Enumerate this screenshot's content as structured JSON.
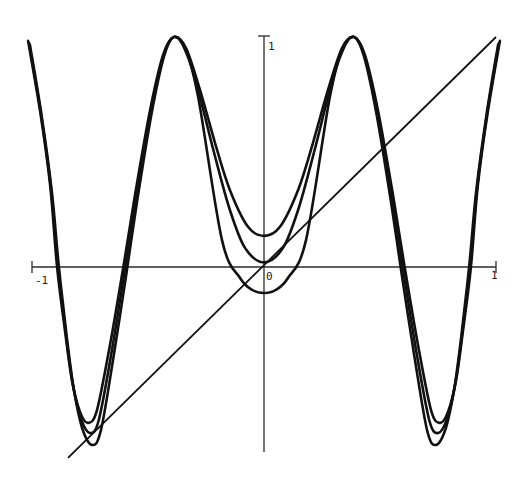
{
  "chart_data": {
    "type": "line",
    "title": "",
    "xlabel": "",
    "ylabel": "",
    "xlim": [
      -1,
      1
    ],
    "ylim": [
      -0.9,
      1
    ],
    "grid": false,
    "legend": null,
    "tick_labels": {
      "x_min": "-1",
      "x_max": "1",
      "origin": "0",
      "y_max": "1"
    },
    "series": [
      {
        "name": "curve-upper",
        "x": [
          -1.017,
          -0.966,
          -0.922,
          -0.892,
          -0.858,
          -0.828,
          -0.793,
          -0.759,
          -0.72,
          -0.664,
          -0.603,
          -0.556,
          -0.491,
          -0.435,
          -0.388,
          -0.336,
          -0.276,
          -0.211,
          -0.147,
          -0.069,
          0
        ],
        "y": [
          0.983,
          0.683,
          0.357,
          0.0,
          -0.274,
          -0.491,
          -0.63,
          -0.678,
          -0.622,
          -0.339,
          0.02,
          0.313,
          0.683,
          0.922,
          1.0,
          0.952,
          0.77,
          0.54,
          0.335,
          0.175,
          0.135
        ],
        "symmetric": true
      },
      {
        "name": "curve-middle",
        "x": [
          -1.013,
          -0.962,
          -0.918,
          -0.888,
          -0.854,
          -0.824,
          -0.789,
          -0.75,
          -0.712,
          -0.657,
          -0.598,
          -0.552,
          -0.488,
          -0.433,
          -0.388,
          -0.338,
          -0.28,
          -0.216,
          -0.147,
          -0.082,
          0
        ],
        "y": [
          0.975,
          0.67,
          0.34,
          0.0,
          -0.29,
          -0.51,
          -0.66,
          -0.722,
          -0.665,
          -0.37,
          0.0,
          0.3,
          0.675,
          0.92,
          1.0,
          0.948,
          0.755,
          0.5,
          0.248,
          0.083,
          0.02
        ],
        "symmetric": true
      },
      {
        "name": "curve-lower",
        "x": [
          -1.009,
          -0.958,
          -0.914,
          -0.884,
          -0.85,
          -0.82,
          -0.784,
          -0.741,
          -0.703,
          -0.65,
          -0.592,
          -0.547,
          -0.485,
          -0.431,
          -0.388,
          -0.34,
          -0.284,
          -0.181,
          -0.103,
          -0.05,
          0
        ],
        "y": [
          0.967,
          0.655,
          0.322,
          0.0,
          -0.305,
          -0.53,
          -0.7,
          -0.774,
          -0.71,
          -0.4,
          -0.02,
          0.285,
          0.665,
          0.915,
          1.0,
          0.944,
          0.74,
          0.117,
          -0.048,
          -0.1,
          -0.113
        ],
        "symmetric": true
      },
      {
        "name": "line-y-equals-x",
        "x": [
          -0.845,
          1.0
        ],
        "y": [
          -0.83,
          1.0
        ],
        "symmetric": false
      }
    ]
  }
}
